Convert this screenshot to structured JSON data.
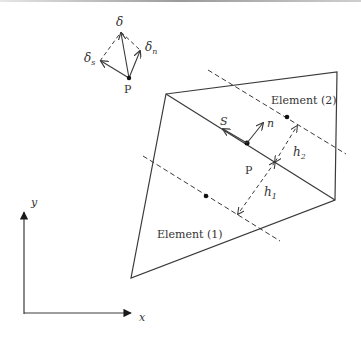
{
  "diagram": {
    "inset": {
      "point_label": "P",
      "delta_label": "δ",
      "delta_s_label": "δ",
      "delta_s_sub": "s",
      "delta_n_label": "δ",
      "delta_n_sub": "n"
    },
    "main": {
      "element1_label": "Element (1)",
      "element2_label": "Element (2)",
      "point_label": "P",
      "s_label": "S",
      "n_label": "n",
      "h1_label": "h",
      "h1_sub": "1",
      "h2_label": "h",
      "h2_sub": "2"
    },
    "axes": {
      "x_label": "x",
      "y_label": "y"
    },
    "colors": {
      "line": "#3a3a3a",
      "text": "#333333"
    }
  }
}
